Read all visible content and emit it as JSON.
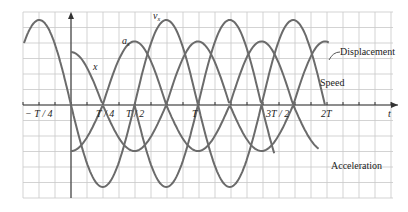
{
  "chart_data": {
    "type": "line",
    "title": "",
    "xlabel": "t",
    "ylabel": "",
    "grid": true,
    "x_ticks": [
      "-T/4",
      "T/4",
      "T/2",
      "T",
      "3T/2",
      "2T"
    ],
    "xlim": [
      "-T/2",
      "2.5T"
    ],
    "series": [
      {
        "name": "Displacement",
        "symbol": "x",
        "form": "|cos(2πt/T)|",
        "amplitude": 0.62,
        "side": "above"
      },
      {
        "name": "Speed",
        "symbol": "v_x",
        "form": "|sin(2πt/T)|",
        "amplitude": 1.0,
        "side": "above"
      },
      {
        "name": "Acceleration",
        "symbol": "a_x",
        "form": "-|cos(2πt/T)| mirrored",
        "amplitude": 0.96,
        "side": "below"
      }
    ],
    "annotations": [
      "x",
      "a_x",
      "v_x"
    ]
  },
  "labels": {
    "x_curve": "x",
    "a_curve": "a",
    "a_sub": "x",
    "v_curve": "v",
    "v_sub": "x",
    "displacement": "Displacement",
    "speed": "Speed",
    "acceleration": "Acceleration",
    "t_axis": "t",
    "tick_neg_quarter": "− T / 4",
    "tick_quarter": "T / 4",
    "tick_half": "T / 2",
    "tick_T": "T",
    "tick_3half": "3T / 2",
    "tick_2T": "2T"
  }
}
